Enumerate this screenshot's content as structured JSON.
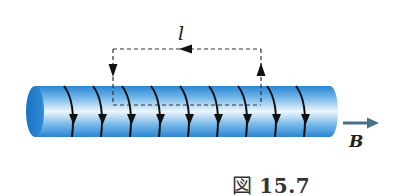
{
  "figure": {
    "caption_prefix": "図",
    "caption_number": "15.7",
    "loop_length_label": "l",
    "field_label": "B",
    "colors": {
      "cylinder_dark": "#1f7fd0",
      "cylinder_light": "#e6f2fb",
      "cylinder_mid": "#5aa9e3",
      "coil": "#111111",
      "dashed_loop": "#333333",
      "field_arrow": "#4a6f8a"
    },
    "solenoid": {
      "turns": 9,
      "current_direction": "down (front side)"
    },
    "loop": {
      "direction": "counterclockwise: up on right, left along top, down on left"
    }
  }
}
